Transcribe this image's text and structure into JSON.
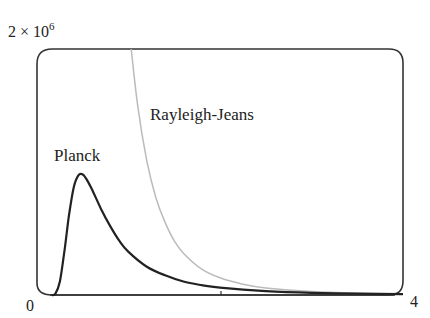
{
  "chart_data": {
    "type": "line",
    "title": "",
    "xlabel": "",
    "ylabel": "",
    "xlim": [
      0,
      4
    ],
    "ylim": [
      0,
      2000000
    ],
    "grid": false,
    "x_tick_labels": [
      "0",
      "4"
    ],
    "x_ticks": [
      0,
      2,
      4
    ],
    "y_tick_labels": [
      "2 × 10^6"
    ],
    "annotations": [
      {
        "text": "Planck",
        "x": 0.32,
        "y": 1180000
      },
      {
        "text": "Rayleigh-Jeans",
        "x": 1.18,
        "y": 1600000
      }
    ],
    "series": [
      {
        "name": "Planck",
        "color": "#222222",
        "x": [
          0.2,
          0.25,
          0.3,
          0.35,
          0.4,
          0.45,
          0.5,
          0.55,
          0.6,
          0.7,
          0.8,
          0.9,
          1.0,
          1.2,
          1.4,
          1.6,
          1.8,
          2.0,
          2.5,
          3.0,
          3.5,
          4.0
        ],
        "values": [
          10000,
          110000,
          360000,
          650000,
          870000,
          970000,
          980000,
          930000,
          860000,
          700000,
          560000,
          440000,
          350000,
          230000,
          160000,
          110000,
          80000,
          60000,
          32000,
          18000,
          11000,
          7000
        ]
      },
      {
        "name": "Rayleigh-Jeans",
        "color": "#bbbbbb",
        "x": [
          1.03,
          1.1,
          1.2,
          1.3,
          1.4,
          1.5,
          1.6,
          1.8,
          2.0,
          2.25,
          2.5,
          3.0,
          3.5,
          4.0
        ],
        "values": [
          2000000,
          1540000,
          1090000,
          790000,
          590000,
          440000,
          340000,
          210000,
          140000,
          88000,
          58000,
          28000,
          15000,
          9000
        ]
      }
    ]
  },
  "labels": {
    "y_top": "2 × 10",
    "y_top_exp": "6",
    "x_min": "0",
    "x_max": "4",
    "planck": "Planck",
    "rayleigh_jeans": "Rayleigh-Jeans"
  }
}
